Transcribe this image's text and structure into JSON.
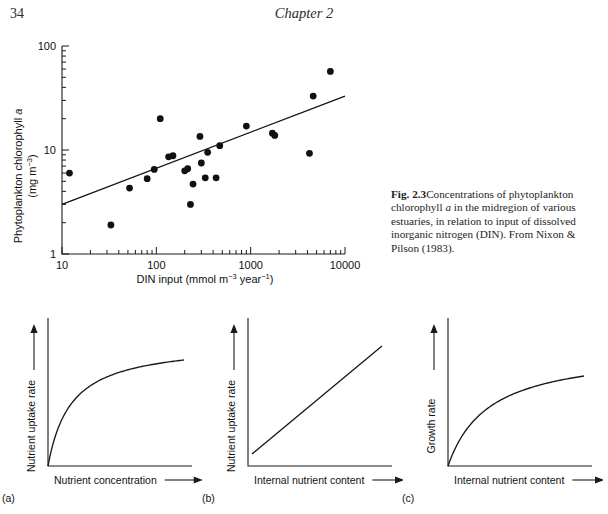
{
  "page": {
    "folio": "34",
    "running_head": "Chapter 2"
  },
  "figure_2_3": {
    "caption_label": "Fig. 2.3",
    "caption_text_1": "Concentrations of phytoplankton chlorophyll ",
    "caption_italic_a": "a",
    "caption_text_2": " in the midregion of various estuaries, in relation to input of dissolved inorganic nitrogen (DIN). From Nixon & Pilson (1983).",
    "axis": {
      "x_title_main": "DIN input (mmol m",
      "x_sup_1": "−3",
      "x_mid": " year",
      "x_sup_2": "−1",
      "x_close": ")",
      "y_title_line1_a": "Phytoplankton chlorophyll ",
      "y_title_line1_b": "a",
      "y_title_line2_main": "(mg m",
      "y_title_line2_sup": "−3",
      "y_title_line2_close": ")",
      "x_ticks": [
        "10",
        "100",
        "1000",
        "10000"
      ],
      "y_ticks": [
        "1",
        "10",
        "100"
      ]
    },
    "chart_data": {
      "type": "scatter",
      "title": "",
      "xlabel": "DIN input (mmol m^-3 year^-1)",
      "ylabel": "Phytoplankton chlorophyll a (mg m^-3)",
      "xscale": "log",
      "yscale": "log",
      "xlim": [
        10,
        10000
      ],
      "ylim": [
        1,
        100
      ],
      "grid": false,
      "legend": "none",
      "points": [
        {
          "x": 12,
          "y": 6.0
        },
        {
          "x": 33,
          "y": 1.9
        },
        {
          "x": 52,
          "y": 4.3
        },
        {
          "x": 80,
          "y": 5.3
        },
        {
          "x": 95,
          "y": 6.5
        },
        {
          "x": 110,
          "y": 20.0
        },
        {
          "x": 135,
          "y": 8.6
        },
        {
          "x": 150,
          "y": 8.8
        },
        {
          "x": 200,
          "y": 6.3
        },
        {
          "x": 215,
          "y": 6.6
        },
        {
          "x": 230,
          "y": 3.0
        },
        {
          "x": 245,
          "y": 4.7
        },
        {
          "x": 290,
          "y": 13.5
        },
        {
          "x": 300,
          "y": 7.5
        },
        {
          "x": 330,
          "y": 5.4
        },
        {
          "x": 350,
          "y": 9.5
        },
        {
          "x": 430,
          "y": 5.4
        },
        {
          "x": 470,
          "y": 11.0
        },
        {
          "x": 900,
          "y": 17.0
        },
        {
          "x": 1700,
          "y": 14.5
        },
        {
          "x": 1800,
          "y": 13.8
        },
        {
          "x": 4200,
          "y": 9.3
        },
        {
          "x": 4600,
          "y": 33.0
        },
        {
          "x": 7000,
          "y": 57.0
        }
      ],
      "fit_line": {
        "name": "regression line",
        "x_start": 10,
        "y_start": 3.0,
        "x_end": 10000,
        "y_end": 33.0
      }
    }
  },
  "panels": [
    {
      "id": "(a)",
      "name": "nutrient-uptake-vs-concentration",
      "xlabel": "Nutrient concentration",
      "ylabel": "Nutrient uptake rate",
      "chart_data": {
        "type": "line",
        "curve": "saturating",
        "xlabel": "Nutrient concentration",
        "ylabel": "Nutrient uptake rate",
        "grid": false,
        "legend": "none",
        "description": "Michaelis-Menten saturation curve rising steeply then plateauing"
      }
    },
    {
      "id": "(b)",
      "name": "nutrient-uptake-vs-internal-content",
      "xlabel": "Internal nutrient content",
      "ylabel": "Nutrient uptake rate",
      "chart_data": {
        "type": "line",
        "curve": "linear",
        "xlabel": "Internal nutrient content",
        "ylabel": "Nutrient uptake rate",
        "grid": false,
        "legend": "none",
        "description": "Straight line increasing from lower left to upper right"
      }
    },
    {
      "id": "(c)",
      "name": "growth-rate-vs-internal-content",
      "xlabel": "Internal nutrient content",
      "ylabel": "Growth rate",
      "chart_data": {
        "type": "line",
        "curve": "saturating",
        "xlabel": "Internal nutrient content",
        "ylabel": "Growth rate",
        "grid": false,
        "legend": "none",
        "description": "Concave curve rising then approaching a plateau"
      }
    }
  ]
}
